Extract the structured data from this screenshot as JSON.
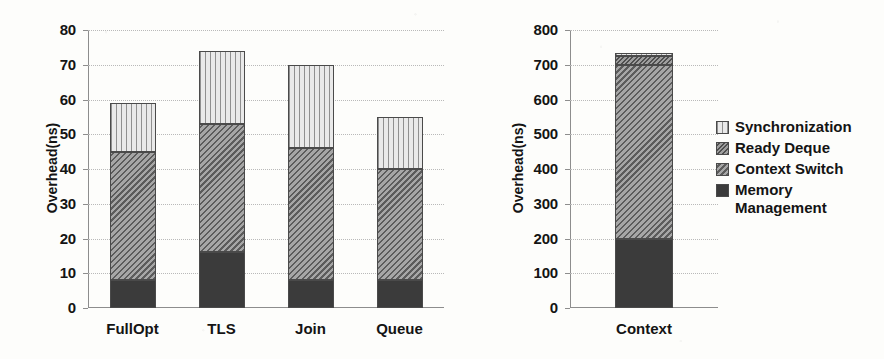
{
  "chart_data": [
    {
      "type": "bar",
      "id": "left",
      "stacked": true,
      "title": "",
      "xlabel": "",
      "ylabel": "Overhead(ns)",
      "ylim": [
        0,
        80
      ],
      "yticks": [
        0,
        10,
        20,
        30,
        40,
        50,
        60,
        70,
        80
      ],
      "ytick_labels": [
        "0",
        "10",
        "20",
        "30",
        "40",
        "50",
        "60",
        "70",
        "80"
      ],
      "grid": true,
      "categories": [
        "FullOpt",
        "TLS",
        "Join",
        "Queue"
      ],
      "series": [
        {
          "name": "Memory Management",
          "values": [
            8,
            16,
            8,
            8
          ]
        },
        {
          "name": "Context Switch",
          "values": [
            37,
            37,
            38,
            32
          ]
        },
        {
          "name": "Ready Deque",
          "values": [
            0,
            0,
            0,
            0
          ]
        },
        {
          "name": "Synchronization",
          "values": [
            14,
            21,
            24,
            15
          ]
        }
      ],
      "totals": [
        59,
        74,
        70,
        55
      ]
    },
    {
      "type": "bar",
      "id": "right",
      "stacked": true,
      "title": "",
      "xlabel": "",
      "ylabel": "Overhead(ns)",
      "ylim": [
        0,
        800
      ],
      "yticks": [
        0,
        100,
        200,
        300,
        400,
        500,
        600,
        700,
        800
      ],
      "ytick_labels": [
        "0",
        "100",
        "200",
        "300",
        "400",
        "500",
        "600",
        "700",
        "800"
      ],
      "grid": true,
      "categories": [
        "Context"
      ],
      "series": [
        {
          "name": "Memory Management",
          "values": [
            198
          ]
        },
        {
          "name": "Context Switch",
          "values": [
            502
          ]
        },
        {
          "name": "Ready Deque",
          "values": [
            25
          ]
        },
        {
          "name": "Synchronization",
          "values": [
            8
          ]
        }
      ],
      "totals": [
        733
      ]
    }
  ],
  "legend": {
    "position": "right",
    "items": [
      {
        "label": "Synchronization",
        "pattern": "vertical-lines",
        "color": "#dcdcdc"
      },
      {
        "label": "Ready Deque",
        "pattern": "fine-hatch",
        "color": "#7d7d7d"
      },
      {
        "label": "Context Switch",
        "pattern": "coarse-hatch",
        "color": "#8a8a8a"
      },
      {
        "label": "Memory\nManagement",
        "pattern": "solid",
        "color": "#3b3b3b"
      }
    ]
  }
}
